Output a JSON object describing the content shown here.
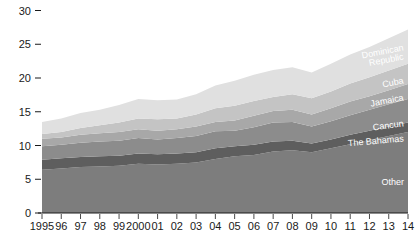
{
  "chart_data": {
    "type": "area",
    "title": "",
    "xlabel": "",
    "ylabel": "",
    "ylim": [
      0,
      31
    ],
    "grid": false,
    "legend_position": "inline-right",
    "x": [
      1995,
      1996,
      1997,
      1998,
      1999,
      2000,
      2001,
      2002,
      2003,
      2004,
      2005,
      2006,
      2007,
      2008,
      2009,
      2010,
      2011,
      2012,
      2013,
      2014
    ],
    "xtick_labels": [
      "1995",
      "96",
      "97",
      "98",
      "99",
      "2000",
      "01",
      "02",
      "03",
      "04",
      "05",
      "06",
      "07",
      "08",
      "09",
      "10",
      "11",
      "12",
      "13",
      "14"
    ],
    "ytick_labels": [
      "0",
      "5",
      "10",
      "15",
      "20",
      "25",
      "30"
    ],
    "ytick_values": [
      0,
      5,
      10,
      15,
      20,
      25,
      30
    ],
    "series": [
      {
        "name": "Other",
        "color": "#7d7d7d",
        "values": [
          6.4,
          6.6,
          6.8,
          6.9,
          7.0,
          7.3,
          7.2,
          7.3,
          7.5,
          8.0,
          8.4,
          8.6,
          9.1,
          9.3,
          9.0,
          9.6,
          10.2,
          10.8,
          11.4,
          12.0
        ]
      },
      {
        "name": "The Bahamas",
        "color": "#5e5e5e",
        "values": [
          1.5,
          1.5,
          1.5,
          1.5,
          1.5,
          1.5,
          1.5,
          1.5,
          1.5,
          1.6,
          1.5,
          1.5,
          1.5,
          1.4,
          1.3,
          1.3,
          1.4,
          1.4,
          1.4,
          1.4
        ]
      },
      {
        "name": "Cancun",
        "color": "#8c8c8c",
        "values": [
          2.0,
          2.0,
          2.1,
          2.2,
          2.2,
          2.3,
          2.2,
          2.3,
          2.4,
          2.5,
          2.3,
          2.6,
          2.8,
          2.8,
          2.5,
          2.7,
          2.9,
          3.1,
          3.3,
          3.5
        ]
      },
      {
        "name": "Jamaica",
        "color": "#a8a8a8",
        "values": [
          1.1,
          1.1,
          1.2,
          1.2,
          1.3,
          1.3,
          1.3,
          1.3,
          1.4,
          1.4,
          1.5,
          1.7,
          1.7,
          1.8,
          1.8,
          1.9,
          2.0,
          2.0,
          2.1,
          2.2
        ]
      },
      {
        "name": "Cuba",
        "color": "#c4c4c4",
        "values": [
          0.7,
          0.8,
          1.0,
          1.2,
          1.4,
          1.6,
          1.7,
          1.6,
          1.8,
          2.0,
          2.2,
          2.2,
          2.1,
          2.3,
          2.4,
          2.5,
          2.7,
          2.8,
          2.9,
          3.0
        ]
      },
      {
        "name": "Dominican Republic",
        "color": "#e0e0e0",
        "values": [
          1.8,
          2.0,
          2.2,
          2.3,
          2.6,
          2.9,
          2.8,
          2.8,
          3.0,
          3.4,
          3.7,
          3.9,
          4.0,
          4.0,
          3.8,
          4.1,
          4.3,
          4.5,
          4.8,
          5.1
        ]
      }
    ],
    "series_labels": [
      {
        "name": "Dominican Republic",
        "text_line1": "Dominican",
        "text_line2": "Republic"
      },
      {
        "name": "Cuba",
        "text": "Cuba"
      },
      {
        "name": "Jamaica",
        "text": "Jamaica"
      },
      {
        "name": "Cancun",
        "text": "Cancun"
      },
      {
        "name": "The Bahamas",
        "text": "The Bahamas"
      },
      {
        "name": "Other",
        "text": "Other"
      }
    ]
  }
}
